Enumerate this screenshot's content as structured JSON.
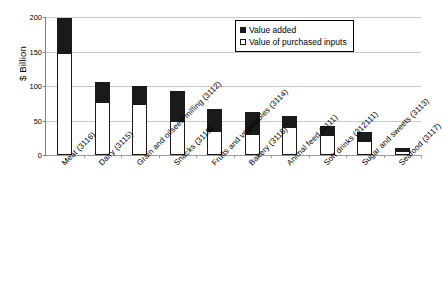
{
  "chart_data": {
    "type": "bar",
    "stacked": true,
    "title": "",
    "xlabel": "",
    "ylabel": "$ Billion",
    "ylim": [
      0,
      200
    ],
    "yticks": [
      0,
      50,
      100,
      150,
      200
    ],
    "ytick_labels": [
      "0",
      "50",
      "100",
      "150",
      "200"
    ],
    "grid": true,
    "legend_position": "top-right",
    "categories": [
      "Meat (3116)",
      "Dairy (3115)",
      "Grain and oilseed milling (3112)",
      "Snacks (3119)",
      "Fruits and vegetables (3114)",
      "Bakery (3118)",
      "Animal feed (3111)",
      "Soft drinks (312111)",
      "Sugar and sweets (3113)",
      "Seafood (3117)"
    ],
    "series": [
      {
        "name": "Value of purchased inputs",
        "color": "#ffffff",
        "values": [
          148,
          77,
          74,
          50,
          35,
          31,
          41,
          30,
          21,
          6
        ]
      },
      {
        "name": "Value added",
        "color": "#1a1a1a",
        "values": [
          52,
          31,
          28,
          45,
          34,
          33,
          18,
          14,
          14,
          6
        ]
      }
    ],
    "totals": [
      200,
      108,
      102,
      95,
      69,
      64,
      59,
      44,
      35,
      12
    ]
  },
  "legend": {
    "items": [
      {
        "label": "Value added",
        "swatch": "filled-black-square"
      },
      {
        "label": "Value of purchased inputs",
        "swatch": "hollow-white-square"
      }
    ]
  },
  "colors": {
    "value_added": "#1a1a1a",
    "purchased_inputs": "#ffffff",
    "gridline": "#c9c9c9",
    "axis": "#808080",
    "text": "#000000"
  }
}
